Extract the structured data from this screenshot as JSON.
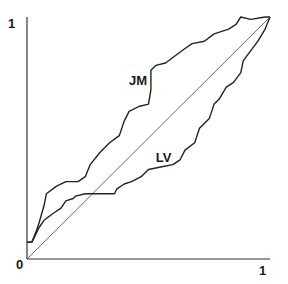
{
  "chart_data": {
    "type": "line",
    "title": "",
    "xlabel": "",
    "ylabel": "",
    "xlim": [
      0,
      1
    ],
    "ylim": [
      0,
      1
    ],
    "grid": false,
    "legend": "inline labels",
    "tick_labels": {
      "x_origin": "0",
      "x_max": "1",
      "y_max": "1"
    },
    "reference_line": {
      "name": "diagonal",
      "x": [
        0,
        1
      ],
      "y": [
        0,
        1
      ]
    },
    "series": [
      {
        "name": "JM",
        "label_pos": [
          0.42,
          0.72
        ],
        "x": [
          0.0,
          0.02,
          0.04,
          0.05,
          0.07,
          0.08,
          0.12,
          0.16,
          0.21,
          0.24,
          0.26,
          0.3,
          0.34,
          0.38,
          0.4,
          0.42,
          0.46,
          0.5,
          0.51,
          0.51,
          0.53,
          0.57,
          0.61,
          0.65,
          0.68,
          0.73,
          0.77,
          0.83,
          0.86,
          0.88,
          0.92,
          0.98,
          1.0
        ],
        "y": [
          0.07,
          0.07,
          0.12,
          0.15,
          0.22,
          0.27,
          0.3,
          0.32,
          0.32,
          0.34,
          0.39,
          0.44,
          0.48,
          0.51,
          0.57,
          0.61,
          0.63,
          0.64,
          0.7,
          0.78,
          0.8,
          0.81,
          0.84,
          0.87,
          0.89,
          0.9,
          0.93,
          0.95,
          0.97,
          1.0,
          0.99,
          1.0,
          1.0
        ]
      },
      {
        "name": "LV",
        "label_pos": [
          0.53,
          0.4
        ],
        "x": [
          0.0,
          0.02,
          0.04,
          0.05,
          0.07,
          0.11,
          0.14,
          0.16,
          0.19,
          0.2,
          0.24,
          0.28,
          0.36,
          0.37,
          0.4,
          0.43,
          0.47,
          0.5,
          0.55,
          0.6,
          0.63,
          0.65,
          0.69,
          0.71,
          0.75,
          0.77,
          0.79,
          0.82,
          0.85,
          0.88,
          0.89,
          0.92,
          0.95,
          0.98,
          1.0
        ],
        "y": [
          0.07,
          0.07,
          0.11,
          0.13,
          0.16,
          0.19,
          0.21,
          0.24,
          0.25,
          0.26,
          0.27,
          0.27,
          0.27,
          0.29,
          0.31,
          0.32,
          0.34,
          0.37,
          0.38,
          0.39,
          0.41,
          0.45,
          0.48,
          0.54,
          0.58,
          0.64,
          0.66,
          0.71,
          0.73,
          0.77,
          0.82,
          0.86,
          0.9,
          0.95,
          1.0
        ]
      }
    ]
  }
}
